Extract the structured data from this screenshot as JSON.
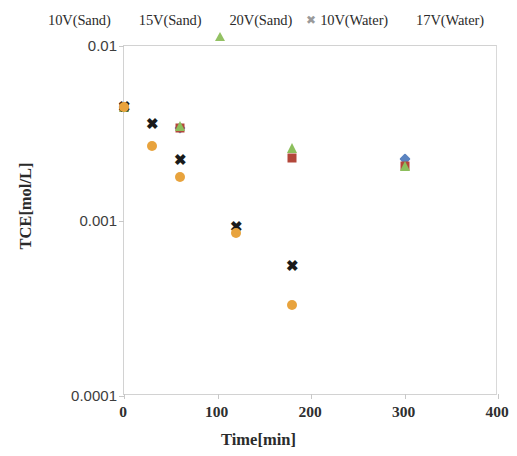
{
  "chart_data": {
    "type": "scatter",
    "title": "",
    "xlabel": "Time[min]",
    "ylabel": "TCE[mol/L]",
    "xlim": [
      0,
      400
    ],
    "ylim": [
      0.0001,
      0.01
    ],
    "yscale": "log",
    "xscale": "linear",
    "grid": false,
    "legend_position": "top",
    "xticks": [
      "0",
      "100",
      "200",
      "300",
      "400"
    ],
    "xtick_values": [
      0,
      100,
      200,
      300,
      400
    ],
    "yticks": [
      "0.01",
      "0.001",
      "0.0001"
    ],
    "ytick_values": [
      0.01,
      0.001,
      0.0001
    ],
    "series": [
      {
        "name": "10V(Sand)",
        "marker": "diamond",
        "color": "#5b83c0",
        "x": [
          0,
          60,
          300
        ],
        "y": [
          0.0045,
          0.0034,
          0.00225
        ]
      },
      {
        "name": "15V(Sand)",
        "marker": "square",
        "color": "#b3473a",
        "x": [
          0,
          60,
          180,
          300
        ],
        "y": [
          0.0045,
          0.0034,
          0.00228,
          0.00205
        ]
      },
      {
        "name": "20V(Sand)",
        "marker": "triangle",
        "color": "#8cbf5c",
        "x": [
          0,
          60,
          180,
          300
        ],
        "y": [
          0.0045,
          0.0035,
          0.0026,
          0.00205
        ]
      },
      {
        "name": "10V(Water)",
        "marker": "cross",
        "color": "#1a1a1a",
        "x": [
          0,
          30,
          60,
          120,
          180
        ],
        "y": [
          0.0045,
          0.0036,
          0.00222,
          0.00092,
          0.00055
        ]
      },
      {
        "name": "17V(Water)",
        "marker": "circle",
        "color": "#e8a33d",
        "x": [
          0,
          30,
          60,
          120,
          180
        ],
        "y": [
          0.0045,
          0.0027,
          0.00178,
          0.00085,
          0.00033
        ]
      }
    ]
  },
  "legend": {
    "entries": [
      {
        "label": "10V(Sand)",
        "icon": "diamond-marker-icon"
      },
      {
        "label": "15V(Sand)",
        "icon": "square-marker-icon"
      },
      {
        "label": "20V(Sand)",
        "icon": "triangle-marker-icon"
      },
      {
        "label": "10V(Water)",
        "icon": "cross-marker-icon"
      },
      {
        "label": "17V(Water)",
        "icon": "circle-marker-icon"
      }
    ]
  },
  "cross_glyph": "✖"
}
